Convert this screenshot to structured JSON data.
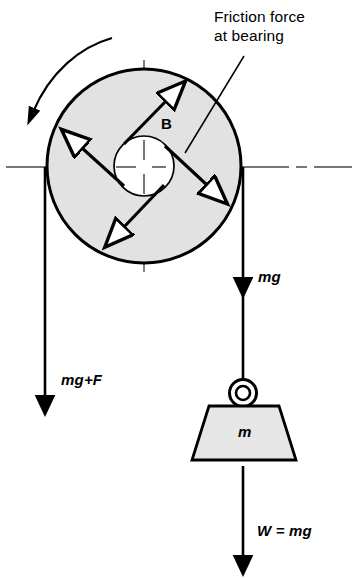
{
  "figure": {
    "background_color": "#ffffff",
    "stroke_color": "#000000",
    "disc_fill_color": "#e2e2e2",
    "centerline_color": "#4a4a4a"
  },
  "labels": {
    "callout_line1": "Friction force",
    "callout_line2": "at bearing",
    "bearing_point": "B",
    "left_tension": "mg+F",
    "right_tension": "mg",
    "block_mass": "m",
    "weight": "W = mg"
  },
  "icons": {
    "rotation_arc": "curved-rotation-arrow-icon",
    "friction_arrows": "double-headed-friction-arrow-icon",
    "down_arrow": "down-arrow-icon",
    "hook_ring": "hook-ring-icon"
  },
  "geometry": {
    "disc_center": {
      "x": 144,
      "y": 166
    },
    "disc_outer_radius": 98,
    "hub_radius": 30,
    "left_rope_x": 45,
    "right_rope_x": 243,
    "left_arrow_tip_y": 400,
    "right_arrow_tip_y": 282,
    "weight_arrow_tip_y": 560
  }
}
